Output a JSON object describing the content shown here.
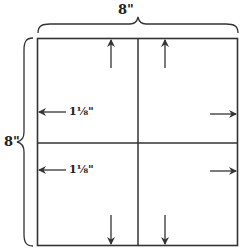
{
  "diagram": {
    "width_label": "8\"",
    "height_label": "8\"",
    "inset_labels": [
      "1⅛\"",
      "1⅛\""
    ],
    "line_color": "#333333",
    "arrows": [
      {
        "direction": "up",
        "quadrant": "top-left"
      },
      {
        "direction": "up",
        "quadrant": "top-right"
      },
      {
        "direction": "left",
        "quadrant": "top-left",
        "label": "1⅛\""
      },
      {
        "direction": "right",
        "quadrant": "top-right"
      },
      {
        "direction": "left",
        "quadrant": "bottom-left",
        "label": "1⅛\""
      },
      {
        "direction": "right",
        "quadrant": "bottom-right"
      },
      {
        "direction": "down",
        "quadrant": "bottom-left"
      },
      {
        "direction": "down",
        "quadrant": "bottom-right"
      }
    ]
  }
}
